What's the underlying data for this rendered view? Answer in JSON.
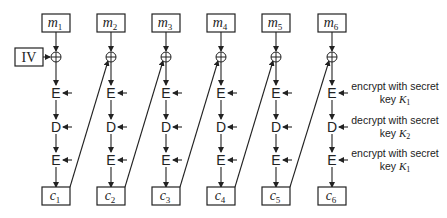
{
  "diagram": {
    "iv_label": "IV",
    "columns": [
      {
        "plaintext": "m",
        "plaintext_sub": "1",
        "ciphertext": "c",
        "ciphertext_sub": "1"
      },
      {
        "plaintext": "m",
        "plaintext_sub": "2",
        "ciphertext": "c",
        "ciphertext_sub": "2"
      },
      {
        "plaintext": "m",
        "plaintext_sub": "3",
        "ciphertext": "c",
        "ciphertext_sub": "3"
      },
      {
        "plaintext": "m",
        "plaintext_sub": "4",
        "ciphertext": "c",
        "ciphertext_sub": "4"
      },
      {
        "plaintext": "m",
        "plaintext_sub": "5",
        "ciphertext": "c",
        "ciphertext_sub": "5"
      },
      {
        "plaintext": "m",
        "plaintext_sub": "6",
        "ciphertext": "c",
        "ciphertext_sub": "6"
      }
    ],
    "xor_symbol": "⊕",
    "stages": [
      {
        "op": "E",
        "label_line1": "encrypt with secret",
        "label_line2": "key",
        "key": "K",
        "key_sub": "1"
      },
      {
        "op": "D",
        "label_line1": "decrypt with secret",
        "label_line2": "key",
        "key": "K",
        "key_sub": "2"
      },
      {
        "op": "E",
        "label_line1": "encrypt with secret",
        "label_line2": "key",
        "key": "K",
        "key_sub": "1"
      }
    ]
  }
}
